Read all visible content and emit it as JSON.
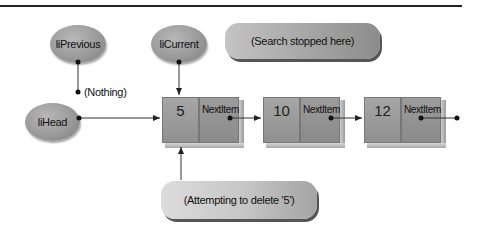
{
  "diagram": {
    "pointers": {
      "previous": "liPrevious",
      "current": "liCurrent",
      "head": "liHead"
    },
    "annotations": {
      "nothing": "(Nothing)",
      "search_stopped": "(Search stopped here)",
      "attempting_delete": "(Attempting to delete '5')"
    },
    "nodes": [
      {
        "value": "5",
        "next_label": "NextItem"
      },
      {
        "value": "10",
        "next_label": "NextItem"
      },
      {
        "value": "12",
        "next_label": "NextItem"
      }
    ],
    "colors": {
      "oval_fill": "#9a9a9a",
      "node_fill": "#969696",
      "line": "#333333",
      "background": "#ffffff"
    }
  }
}
